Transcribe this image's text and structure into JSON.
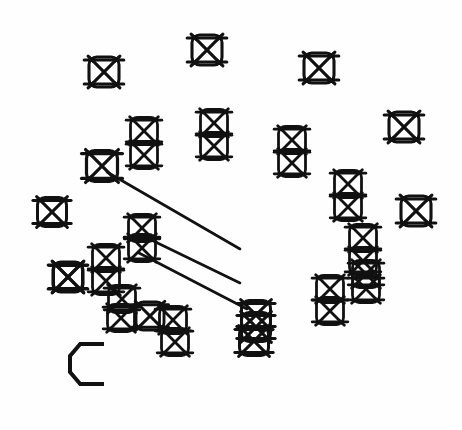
{
  "document": {
    "title": "Hatched Box Symbol Scatter Diagram",
    "background_color": "#fefefe",
    "ink_color": "#111111",
    "width": 462,
    "height": 430,
    "description": "Scanned line-art diagram: a field of crossed/hatched box symbols scattered and clustered, three parallel diagonal leader lines running from upper-left to lower-right, and a single squared letter C label at lower left."
  },
  "labels": [
    {
      "name": "label-c",
      "text": "C",
      "x": 70,
      "y": 344,
      "width": 34,
      "height": 40,
      "stroke_width": 4
    }
  ],
  "leader_lines": {
    "count": 3,
    "stroke_width": 2.6,
    "color": "#111111",
    "segments": [
      {
        "name": "leader-line-1",
        "x1": 107,
        "y1": 172,
        "x2": 240,
        "y2": 249
      },
      {
        "name": "leader-line-2",
        "x1": 139,
        "y1": 234,
        "x2": 240,
        "y2": 283
      },
      {
        "name": "leader-line-3",
        "x1": 139,
        "y1": 253,
        "x2": 247,
        "y2": 309
      }
    ]
  },
  "glyph_style": {
    "name": "hatched-box",
    "description": "Rounded square outline with an X of two diagonals inside, plus horizontal bars across top and bottom that overshoot the left and right edges.",
    "base_size": 30,
    "stroke_width": 3.1,
    "overshoot": 0.16
  },
  "glyphs": [
    {
      "name": "glyph-top-left",
      "cx": 104,
      "cy": 72,
      "size": 30
    },
    {
      "name": "glyph-top-center",
      "cx": 207,
      "cy": 50,
      "size": 30
    },
    {
      "name": "glyph-top-right",
      "cx": 319,
      "cy": 68,
      "size": 30
    },
    {
      "name": "glyph-upper-right-far",
      "cx": 404,
      "cy": 127,
      "size": 30
    },
    {
      "name": "glyph-mid-left-a",
      "cx": 144,
      "cy": 131,
      "size": 27
    },
    {
      "name": "glyph-mid-left-b",
      "cx": 144,
      "cy": 155,
      "size": 27
    },
    {
      "name": "glyph-mid-center-a",
      "cx": 214,
      "cy": 123,
      "size": 27
    },
    {
      "name": "glyph-mid-center-b",
      "cx": 214,
      "cy": 146,
      "size": 27
    },
    {
      "name": "glyph-mid-right-a",
      "cx": 292,
      "cy": 140,
      "size": 27
    },
    {
      "name": "glyph-mid-right-b",
      "cx": 292,
      "cy": 163,
      "size": 27
    },
    {
      "name": "glyph-anchor-upper",
      "cx": 102,
      "cy": 166,
      "size": 31
    },
    {
      "name": "glyph-right-col-a",
      "cx": 348,
      "cy": 184,
      "size": 27
    },
    {
      "name": "glyph-right-col-b",
      "cx": 348,
      "cy": 207,
      "size": 27
    },
    {
      "name": "glyph-far-right-mid",
      "cx": 416,
      "cy": 211,
      "size": 30
    },
    {
      "name": "glyph-left-edge-a",
      "cx": 52,
      "cy": 212,
      "size": 29
    },
    {
      "name": "glyph-left-edge-b",
      "cx": 68,
      "cy": 277,
      "size": 29
    },
    {
      "name": "glyph-anchor-mid-a",
      "cx": 142,
      "cy": 228,
      "size": 27
    },
    {
      "name": "glyph-anchor-mid-b",
      "cx": 142,
      "cy": 248,
      "size": 27
    },
    {
      "name": "glyph-chain-a",
      "cx": 106,
      "cy": 258,
      "size": 27
    },
    {
      "name": "glyph-chain-b",
      "cx": 106,
      "cy": 281,
      "size": 27
    },
    {
      "name": "glyph-chain-c",
      "cx": 122,
      "cy": 299,
      "size": 27
    },
    {
      "name": "glyph-chain-d",
      "cx": 121,
      "cy": 318,
      "size": 27
    },
    {
      "name": "glyph-chain-e",
      "cx": 150,
      "cy": 316,
      "size": 28
    },
    {
      "name": "glyph-chain-f",
      "cx": 173,
      "cy": 320,
      "size": 27
    },
    {
      "name": "glyph-chain-g",
      "cx": 175,
      "cy": 342,
      "size": 27
    },
    {
      "name": "glyph-left-block",
      "cx": 68,
      "cy": 277,
      "size": 30
    },
    {
      "name": "glyph-stack-right-a",
      "cx": 363,
      "cy": 238,
      "size": 27
    },
    {
      "name": "glyph-stack-right-b",
      "cx": 363,
      "cy": 261,
      "size": 27
    },
    {
      "name": "glyph-stack-right-c",
      "cx": 366,
      "cy": 274,
      "size": 27
    },
    {
      "name": "glyph-stack-right-d",
      "cx": 366,
      "cy": 289,
      "size": 27
    },
    {
      "name": "glyph-lower-right-a",
      "cx": 330,
      "cy": 289,
      "size": 27
    },
    {
      "name": "glyph-lower-right-b",
      "cx": 330,
      "cy": 311,
      "size": 27
    },
    {
      "name": "glyph-cluster-a",
      "cx": 256,
      "cy": 315,
      "size": 29
    },
    {
      "name": "glyph-cluster-b",
      "cx": 256,
      "cy": 327,
      "size": 29
    },
    {
      "name": "glyph-cluster-c",
      "cx": 254,
      "cy": 341,
      "size": 29
    }
  ]
}
